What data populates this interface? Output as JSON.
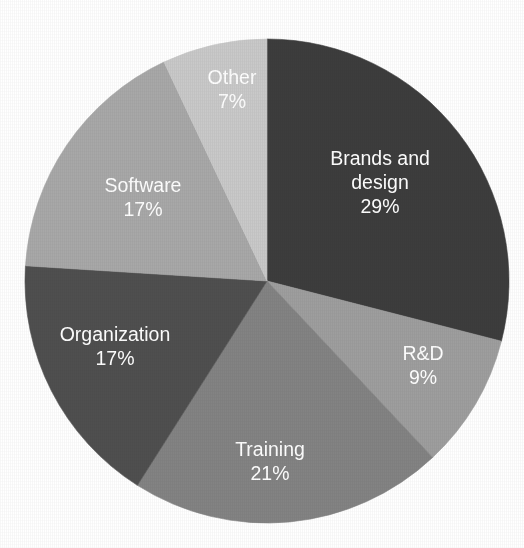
{
  "chart_data": {
    "type": "pie",
    "title": "",
    "subtitle": "",
    "xlabel": "",
    "ylabel": "",
    "legend_position": "none",
    "grid": false,
    "labels_inside_slices": true,
    "value_unit": "%",
    "start_angle_deg": 0,
    "direction": "clockwise",
    "categories": [
      "Brands and design",
      "R&D",
      "Training",
      "Organization",
      "Software",
      "Other"
    ],
    "values": [
      29,
      9,
      21,
      17,
      17,
      7
    ],
    "total": 100,
    "colors": [
      "#3d3d3d",
      "#9e9e9e",
      "#838383",
      "#4f4f4f",
      "#a8a8a8",
      "#c9c9c9"
    ],
    "slices": [
      {
        "name": "Brands and design",
        "value": 29,
        "value_label": "29%",
        "color": "#3d3d3d",
        "label_lines": [
          "Brands and",
          "design",
          "29%"
        ],
        "label_x": 380,
        "label_y": 165
      },
      {
        "name": "R&D",
        "value": 9,
        "value_label": "9%",
        "color": "#9e9e9e",
        "label_lines": [
          "R&D",
          "9%"
        ],
        "label_x": 423,
        "label_y": 360
      },
      {
        "name": "Training",
        "value": 21,
        "value_label": "21%",
        "color": "#838383",
        "label_lines": [
          "Training",
          "21%"
        ],
        "label_x": 270,
        "label_y": 456
      },
      {
        "name": "Organization",
        "value": 17,
        "value_label": "17%",
        "color": "#4f4f4f",
        "label_lines": [
          "Organization",
          "17%"
        ],
        "label_x": 115,
        "label_y": 341
      },
      {
        "name": "Software",
        "value": 17,
        "value_label": "17%",
        "color": "#a8a8a8",
        "label_lines": [
          "Software",
          "17%"
        ],
        "label_x": 143,
        "label_y": 192
      },
      {
        "name": "Other",
        "value": 7,
        "value_label": "7%",
        "color": "#c9c9c9",
        "label_lines": [
          "Other",
          "7%"
        ],
        "label_x": 232,
        "label_y": 84
      }
    ],
    "geometry": {
      "center_x": 267,
      "center_y": 281,
      "radius": 242
    },
    "background_color": "#ffffff",
    "label_text_color": "#ffffff"
  }
}
